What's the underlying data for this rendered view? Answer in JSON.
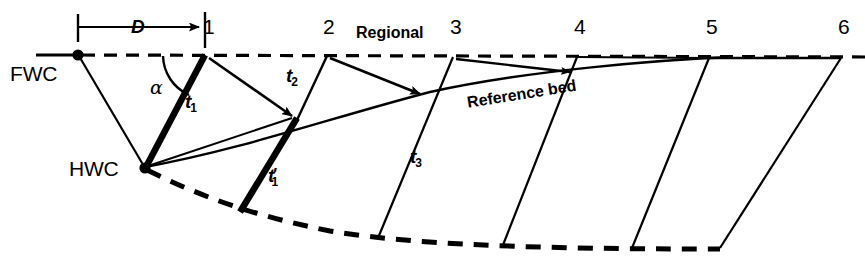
{
  "figure": {
    "background_color": "#ffffff",
    "line_color": "#000000",
    "width": 865,
    "height": 265
  },
  "labels": {
    "fwc": "FWC",
    "hwc": "HWC",
    "regional": "Regional",
    "reference_bed": "Reference bed",
    "displacement": "D",
    "alpha": "α",
    "t1": "t",
    "t1_sub": "1",
    "t1p": "t",
    "t1p_sub": "1",
    "t1p_prime": "'",
    "t2": "t",
    "t2_sub": "2",
    "t3": "t",
    "t3_sub": "3"
  },
  "markers": [
    {
      "id": "1",
      "label": "1",
      "x": 205,
      "y": 30
    },
    {
      "id": "2",
      "label": "2",
      "x": 327,
      "y": 30
    },
    {
      "id": "3",
      "label": "3",
      "x": 453,
      "y": 30
    },
    {
      "id": "4",
      "label": "4",
      "x": 577,
      "y": 30
    },
    {
      "id": "5",
      "label": "5",
      "x": 709,
      "y": 30
    },
    {
      "id": "6",
      "label": "6",
      "x": 841,
      "y": 30
    }
  ],
  "points": {
    "fwc": {
      "x": 78,
      "y": 55
    },
    "hwc": {
      "x": 145,
      "y": 168
    },
    "bed1_top": {
      "x": 205,
      "y": 55
    },
    "bed1_bottom": {
      "x": 297,
      "y": 121
    },
    "bed2_top": {
      "x": 327,
      "y": 56
    },
    "bed2_bottom": {
      "x": 240,
      "y": 211
    },
    "bed3_top": {
      "x": 453,
      "y": 57
    },
    "bed4_top": {
      "x": 577,
      "y": 57
    },
    "bed5_top": {
      "x": 709,
      "y": 58
    },
    "bed6_top": {
      "x": 841,
      "y": 58
    }
  },
  "annotations": {
    "d_arrow_start_x": 78,
    "d_arrow_end_x": 205,
    "d_arrow_y": 27,
    "regional_line_y": 55,
    "alpha_arc_note": "angle between regional datum and t1 fault segment"
  }
}
